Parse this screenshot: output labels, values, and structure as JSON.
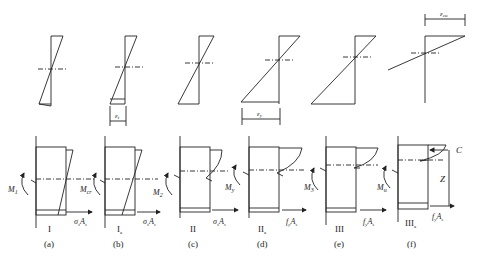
{
  "diagram": {
    "strain_labels": {
      "b": "ε_t",
      "d": "ε_y",
      "f": "ε_cu"
    },
    "panels": [
      {
        "id": "a",
        "stage": "I",
        "moment": "M_1",
        "force": "σ_sA_s",
        "caption": "(a)"
      },
      {
        "id": "b",
        "stage": "I_a",
        "moment": "M_cr",
        "force": "σ_sA_s",
        "caption": "(b)"
      },
      {
        "id": "c",
        "stage": "II",
        "moment": "M_2",
        "force": "σ_sA_s",
        "caption": "(c)"
      },
      {
        "id": "d",
        "stage": "II_a",
        "moment": "M_y",
        "force": "f_yA_s",
        "caption": "(d)"
      },
      {
        "id": "e",
        "stage": "III",
        "moment": "M_3",
        "force": "f_yA_s",
        "caption": "(e)"
      },
      {
        "id": "f",
        "stage": "III_a",
        "moment": "M_u",
        "force": "f_yA_s",
        "caption": "(f)"
      }
    ],
    "extra_labels": {
      "compression": "C",
      "lever_arm": "Z"
    }
  }
}
